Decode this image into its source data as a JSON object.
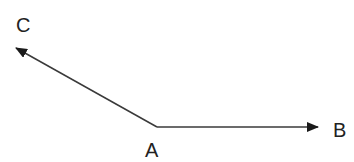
{
  "diagram": {
    "type": "vector-angle",
    "colors": {
      "line": "#3a3a3a",
      "label": "#222222",
      "background": "#ffffff"
    },
    "points": {
      "A": {
        "label": "A",
        "x": 157,
        "y": 127
      },
      "B": {
        "label": "B",
        "x": 318,
        "y": 127
      },
      "C": {
        "label": "C",
        "x": 16,
        "y": 48
      }
    },
    "vectors": [
      {
        "from": "A",
        "to": "B",
        "name": "AB"
      },
      {
        "from": "A",
        "to": "C",
        "name": "AC"
      }
    ],
    "labels": {
      "A": "A",
      "B": "B",
      "C": "C"
    }
  }
}
